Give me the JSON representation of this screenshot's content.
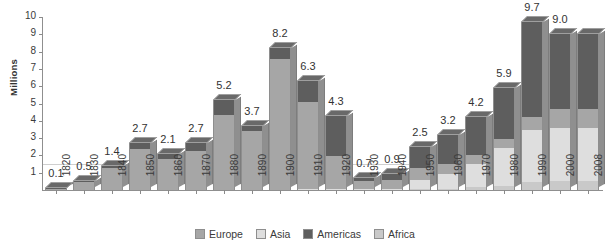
{
  "chart_data": {
    "type": "bar",
    "stacked": true,
    "title": "",
    "xlabel": "",
    "ylabel": "Millions",
    "ylim": [
      0,
      10
    ],
    "yticks": [
      "0",
      "1",
      "2",
      "3",
      "4",
      "5",
      "6",
      "7",
      "8",
      "9",
      "10"
    ],
    "grid": "single faint horizontal line near 1.5",
    "legend_position": "bottom-center",
    "categories": [
      "1820",
      "1830",
      "1840",
      "1850",
      "1860",
      "1870",
      "1880",
      "1890",
      "1900",
      "1910",
      "1920",
      "1930",
      "1940",
      "1950",
      "1960",
      "1970",
      "1980",
      "1990",
      "2000",
      "2008"
    ],
    "totals": [
      0.1,
      0.5,
      1.4,
      2.7,
      2.1,
      2.7,
      5.2,
      3.7,
      8.2,
      6.3,
      4.3,
      0.7,
      0.9,
      2.5,
      3.2,
      4.2,
      5.9,
      9.7,
      9.0,
      9.0
    ],
    "total_labels": [
      "0.1",
      "0.5",
      "1.4",
      "2.7",
      "2.1",
      "2.7",
      "5.2",
      "3.7",
      "8.2",
      "6.3",
      "4.3",
      "0.7",
      "0.9",
      "2.5",
      "3.2",
      "4.2",
      "5.9",
      "9.7",
      "9.0",
      ""
    ],
    "series": [
      {
        "name": "Africa",
        "color": "#c9c9c9",
        "values": [
          0.0,
          0.0,
          0.0,
          0.0,
          0.0,
          0.0,
          0.0,
          0.0,
          0.0,
          0.0,
          0.0,
          0.0,
          0.0,
          0.05,
          0.08,
          0.15,
          0.25,
          0.45,
          0.5,
          0.5
        ]
      },
      {
        "name": "Asia",
        "color": "#dedede",
        "values": [
          0.0,
          0.0,
          0.0,
          0.0,
          0.0,
          0.0,
          0.0,
          0.0,
          0.0,
          0.05,
          0.05,
          0.05,
          0.05,
          0.55,
          0.85,
          1.35,
          2.15,
          3.0,
          3.1,
          3.1
        ]
      },
      {
        "name": "Europe",
        "color": "#a6a6a6",
        "values": [
          0.08,
          0.45,
          1.3,
          2.35,
          1.8,
          2.25,
          4.35,
          3.4,
          7.6,
          5.05,
          1.9,
          0.45,
          0.55,
          0.65,
          0.6,
          0.55,
          0.55,
          0.75,
          1.1,
          1.1
        ]
      },
      {
        "name": "Americas",
        "color": "#5e5e5e",
        "values": [
          0.02,
          0.05,
          0.1,
          0.35,
          0.3,
          0.45,
          0.85,
          0.3,
          0.6,
          1.2,
          2.35,
          0.2,
          0.3,
          1.25,
          1.67,
          2.15,
          2.95,
          5.5,
          4.3,
          4.3
        ]
      }
    ],
    "stack_order_bottom_to_top": [
      "Africa",
      "Asia",
      "Europe",
      "Americas"
    ],
    "legend": [
      {
        "label": "Europe",
        "color": "#a6a6a6"
      },
      {
        "label": "Asia",
        "color": "#dedede"
      },
      {
        "label": "Americas",
        "color": "#5e5e5e"
      },
      {
        "label": "Africa",
        "color": "#c9c9c9"
      }
    ]
  }
}
